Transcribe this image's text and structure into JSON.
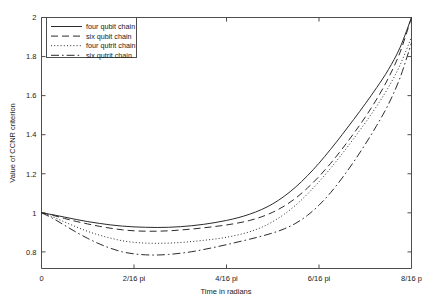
{
  "chart_data": {
    "type": "line",
    "title": "",
    "xlabel": "Time in radians",
    "ylabel": "Value of CCNR criterion",
    "xlim": [
      0,
      0.5
    ],
    "ylim": [
      0.715,
      2.0
    ],
    "grid": false,
    "legend_position": "top-left",
    "xtick_labels": [
      "0",
      "2/16 pi",
      "4/16 pi",
      "6/16 pi",
      "8/16 p"
    ],
    "xtick_values": [
      0,
      0.125,
      0.25,
      0.375,
      0.5
    ],
    "ytick_labels": [
      "0.8",
      "1",
      "1.2",
      "1.4",
      "1.6",
      "1.8",
      "2"
    ],
    "ytick_values": [
      0.8,
      1.0,
      1.2,
      1.4,
      1.6,
      1.8,
      2.0
    ],
    "x": [
      0,
      0.015625,
      0.03125,
      0.046875,
      0.0625,
      0.078125,
      0.09375,
      0.109375,
      0.125,
      0.140625,
      0.15625,
      0.171875,
      0.1875,
      0.203125,
      0.21875,
      0.234375,
      0.25,
      0.265625,
      0.28125,
      0.296875,
      0.3125,
      0.328125,
      0.34375,
      0.359375,
      0.375,
      0.390625,
      0.40625,
      0.421875,
      0.4375,
      0.453125,
      0.46875,
      0.484375,
      0.5
    ],
    "series": [
      {
        "name": "four qubit chain",
        "style": "solid",
        "values": [
          1.0,
          0.99,
          0.978,
          0.966,
          0.955,
          0.946,
          0.938,
          0.932,
          0.928,
          0.926,
          0.925,
          0.926,
          0.929,
          0.934,
          0.941,
          0.95,
          0.961,
          0.975,
          0.993,
          1.016,
          1.046,
          1.085,
          1.133,
          1.19,
          1.254,
          1.325,
          1.4,
          1.478,
          1.558,
          1.642,
          1.733,
          1.845,
          2.0
        ]
      },
      {
        "name": "six qubit chain",
        "style": "dashed",
        "values": [
          1.0,
          0.987,
          0.971,
          0.956,
          0.943,
          0.931,
          0.921,
          0.913,
          0.908,
          0.906,
          0.906,
          0.908,
          0.912,
          0.917,
          0.923,
          0.93,
          0.938,
          0.948,
          0.961,
          0.979,
          1.003,
          1.035,
          1.076,
          1.127,
          1.186,
          1.253,
          1.327,
          1.406,
          1.49,
          1.583,
          1.69,
          1.82,
          2.0
        ]
      },
      {
        "name": "four qutrit chain",
        "style": "dotted",
        "values": [
          1.0,
          0.979,
          0.953,
          0.928,
          0.905,
          0.886,
          0.87,
          0.857,
          0.849,
          0.845,
          0.844,
          0.845,
          0.848,
          0.853,
          0.859,
          0.866,
          0.875,
          0.887,
          0.903,
          0.925,
          0.955,
          0.993,
          1.04,
          1.096,
          1.159,
          1.228,
          1.302,
          1.38,
          1.461,
          1.547,
          1.642,
          1.755,
          1.9
        ]
      },
      {
        "name": "six qutrit chain",
        "style": "dashdot",
        "values": [
          1.0,
          0.971,
          0.936,
          0.901,
          0.869,
          0.841,
          0.818,
          0.8,
          0.79,
          0.785,
          0.784,
          0.787,
          0.793,
          0.801,
          0.812,
          0.824,
          0.837,
          0.851,
          0.865,
          0.88,
          0.897,
          0.918,
          0.947,
          0.987,
          1.039,
          1.103,
          1.178,
          1.261,
          1.351,
          1.448,
          1.555,
          1.69,
          1.87
        ]
      }
    ]
  },
  "legend": {
    "entries": [
      {
        "label": "four qubit chain"
      },
      {
        "label": "six qubit chain"
      },
      {
        "label": "four qutrit chain"
      },
      {
        "label": "six qutrit chain"
      }
    ]
  }
}
